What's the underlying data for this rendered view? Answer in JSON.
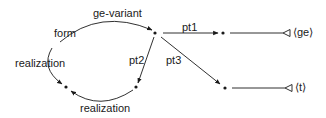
{
  "diagram": {
    "nodes": [
      {
        "id": "n_top",
        "x": 155,
        "y": 33
      },
      {
        "id": "n_pt1",
        "x": 222,
        "y": 33
      },
      {
        "id": "n_pt3",
        "x": 225,
        "y": 88
      },
      {
        "id": "n_left",
        "x": 66,
        "y": 87
      },
      {
        "id": "n_right",
        "x": 136,
        "y": 87
      }
    ],
    "edges": {
      "ge_variant": "ge-variant",
      "form": "form",
      "realization_left": "realization",
      "realization_bottom": "realization",
      "pt1": "pt1",
      "pt2": "pt2",
      "pt3": "pt3"
    },
    "terminals": {
      "ge": "⟨ge⟩",
      "t": "⟨t⟩"
    },
    "colors": {
      "stroke": "#1a1a1a",
      "background": "#ffffff"
    }
  }
}
